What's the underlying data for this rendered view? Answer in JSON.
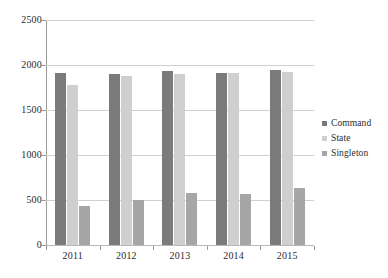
{
  "chart_data": {
    "type": "bar",
    "title": "",
    "subtitle": "",
    "xlabel": "",
    "ylabel": "",
    "categories": [
      "2011",
      "2012",
      "2013",
      "2014",
      "2015"
    ],
    "series": [
      {
        "name": "Command",
        "color": "#7b7b7b",
        "values": [
          1915,
          1900,
          1935,
          1915,
          1950
        ]
      },
      {
        "name": "State",
        "color": "#cfcfcf",
        "values": [
          1775,
          1875,
          1895,
          1915,
          1920
        ]
      },
      {
        "name": "Singleton",
        "color": "#a6a6a6",
        "values": [
          430,
          505,
          575,
          565,
          635
        ]
      }
    ],
    "ylim": [
      0,
      2500
    ],
    "ytick_step": 500,
    "yticks": [
      "0",
      "500",
      "1000",
      "1500",
      "2000",
      "2500"
    ],
    "grid": "horizontal",
    "legend_position": "right",
    "legend_marker": "square-swatch"
  },
  "axes": {
    "y_axis_name": "value-axis",
    "x_axis_name": "category-axis"
  }
}
